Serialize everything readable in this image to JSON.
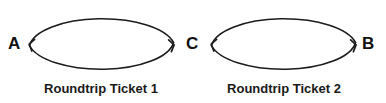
{
  "canvas": {
    "width": 386,
    "height": 103,
    "background_color": "#ffffff",
    "stroke_color": "#1c1c1c",
    "text_color": "#111111"
  },
  "diagram": {
    "type": "directed-cycle-graph",
    "nodes": [
      {
        "id": "A",
        "label": "A",
        "x": 16,
        "y": 44
      },
      {
        "id": "C",
        "label": "C",
        "x": 193,
        "y": 44
      },
      {
        "id": "B",
        "label": "B",
        "x": 370,
        "y": 44
      }
    ],
    "cycles": [
      {
        "id": "cycle-1",
        "caption": "Roundtrip Ticket 1",
        "caption_x": 101,
        "caption_y": 93,
        "from": "A",
        "to": "C",
        "ellipse": {
          "cx": 101.5,
          "cy": 44,
          "rx": 73,
          "ry": 30
        },
        "arrow_at_left": "A",
        "arrow_at_right": "C"
      },
      {
        "id": "cycle-2",
        "caption": "Roundtrip Ticket 2",
        "caption_x": 284,
        "caption_y": 93,
        "from": "C",
        "to": "B",
        "ellipse": {
          "cx": 283.5,
          "cy": 44,
          "rx": 73,
          "ry": 30
        },
        "arrow_at_left": "C",
        "arrow_at_right": "B"
      }
    ]
  }
}
